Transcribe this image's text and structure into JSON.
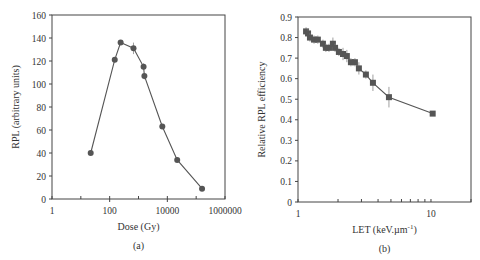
{
  "chart_data": [
    {
      "id": "a",
      "type": "line",
      "caption": "(a)",
      "title": "",
      "xlabel": "Dose (Gy)",
      "ylabel": "RPL (arbitrary units)",
      "xscale": "log",
      "xlim": [
        1,
        1000000
      ],
      "ylim": [
        0,
        160
      ],
      "xticks": [
        1,
        100,
        10000,
        1000000
      ],
      "xtick_labels": [
        "1",
        "100",
        "10000",
        "1000000"
      ],
      "yticks": [
        0,
        20,
        40,
        60,
        80,
        100,
        120,
        140,
        160
      ],
      "ytick_labels": [
        "0",
        "20",
        "40",
        "60",
        "80",
        "100",
        "120",
        "140",
        "160"
      ],
      "marker": "circle",
      "color": "#555555",
      "x": [
        22,
        150,
        240,
        670,
        1500,
        1600,
        6700,
        22000,
        160000
      ],
      "y": [
        40,
        121,
        136,
        131,
        115,
        107,
        63,
        34,
        9
      ],
      "yerr": [
        0,
        2,
        2,
        5,
        3,
        3,
        2,
        2,
        1
      ]
    },
    {
      "id": "b",
      "type": "line",
      "caption": "(b)",
      "title": "",
      "xlabel": "LET (keV.µm",
      "xlabel_sup": "-1",
      "xlabel_end": ")",
      "ylabel": "Relative RPL efficiency",
      "xscale": "log",
      "xlim": [
        1,
        20
      ],
      "ylim": [
        0,
        0.9
      ],
      "xticks": [
        1,
        10
      ],
      "xtick_labels": [
        "1",
        "10"
      ],
      "yticks": [
        0,
        0.1,
        0.2,
        0.3,
        0.4,
        0.5,
        0.6,
        0.7,
        0.8,
        0.9
      ],
      "ytick_labels": [
        "0",
        "0.1",
        "0.2",
        "0.3",
        "0.4",
        "0.5",
        "0.6",
        "0.7",
        "0.8",
        "0.9"
      ],
      "marker": "square",
      "color": "#555555",
      "x": [
        1.15,
        1.19,
        1.23,
        1.32,
        1.41,
        1.54,
        1.62,
        1.71,
        1.83,
        1.9,
        2.03,
        2.18,
        2.33,
        2.5,
        2.68,
        2.87,
        3.24,
        3.66,
        4.83,
        10.3
      ],
      "y": [
        0.83,
        0.82,
        0.8,
        0.79,
        0.79,
        0.77,
        0.75,
        0.75,
        0.77,
        0.75,
        0.73,
        0.72,
        0.71,
        0.68,
        0.68,
        0.65,
        0.62,
        0.58,
        0.51,
        0.43
      ],
      "yerr": [
        0.02,
        0.02,
        0.02,
        0.02,
        0.02,
        0.02,
        0.02,
        0.02,
        0.03,
        0.02,
        0.02,
        0.03,
        0.03,
        0.02,
        0.02,
        0.03,
        0.02,
        0.04,
        0.05,
        0.01
      ]
    }
  ],
  "layout": {
    "panels": [
      {
        "left": 52,
        "right": 225,
        "top": 15,
        "bottom": 199
      },
      {
        "left": 298,
        "right": 471,
        "top": 17,
        "bottom": 202
      }
    ]
  }
}
